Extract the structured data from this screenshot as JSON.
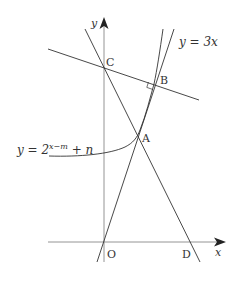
{
  "diagram": {
    "type": "coordinate-geometry",
    "axes": {
      "x_label": "x",
      "y_label": "y",
      "origin_label": "O"
    },
    "points": {
      "O": "O",
      "A": "A",
      "B": "B",
      "C": "C",
      "D": "D"
    },
    "curves": {
      "line_label_prefix": "y = 3",
      "line_label_var": "x",
      "exp_label_lhs": "y = 2",
      "exp_label_exponent": "x−m",
      "exp_label_tail": " + n"
    },
    "annotations": {
      "right_angle_at": "B"
    },
    "colors": {
      "stroke": "#333333",
      "axis": "#777777",
      "background": "#ffffff"
    }
  }
}
